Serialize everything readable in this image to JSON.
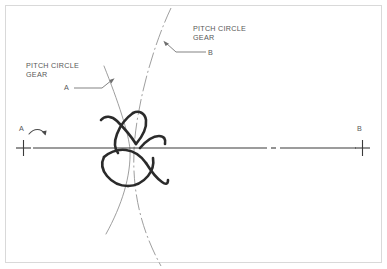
{
  "figure": {
    "background_color": "#ffffff",
    "frame_color": "#d9d9d9",
    "width": 387,
    "height": 269
  },
  "labels": {
    "pitch_circle_gear_a": "PITCH CIRCLE\nGEAR",
    "gear_a_id": "A",
    "pitch_circle_gear_b": "PITCH CIRCLE\nGEAR",
    "gear_b_id": "B",
    "axis_left_id": "A",
    "axis_right_id": "B"
  },
  "colors": {
    "text": "#585858",
    "centerline": "#3a3a3a",
    "pitch_circle_a": "#8c8c8c",
    "pitch_circle_b": "#8c8c8c",
    "gear_teeth": "#2b2b2b",
    "leader": "#6e6e6e"
  },
  "geometry": {
    "centerline_y": 148,
    "center_mark_left_x": 23,
    "center_mark_right_x": 362,
    "mesh_point_x": 131,
    "pitch_circle_a_note": "thin solid arc, convex toward right, gear A center off-image at left",
    "pitch_circle_b_note": "dash-dot arc, convex toward left, gear B center off-image at right",
    "rotation_arrow": "clockwise arc above left axis mark"
  }
}
